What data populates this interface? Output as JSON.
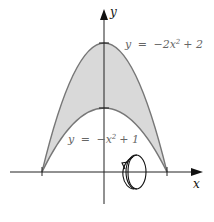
{
  "diagram": {
    "axes": {
      "x_label": "x",
      "y_label": "y"
    },
    "curves": [
      {
        "name": "outer",
        "equation_label": "y = −2x² + 2",
        "lhs": "y",
        "eq": "=",
        "rhs_a": "−2x",
        "sup": "2",
        "rhs_b": "+ 2"
      },
      {
        "name": "inner",
        "equation_label": "y = −x² + 1",
        "lhs": "y",
        "eq": "=",
        "rhs_a": "−x",
        "sup": "2",
        "rhs_b": "+ 1"
      }
    ],
    "region_fill": "#d9d9d9",
    "curve_color": "#777777",
    "rotation_axis": "x",
    "annotation": "revolution about the x-axis"
  }
}
